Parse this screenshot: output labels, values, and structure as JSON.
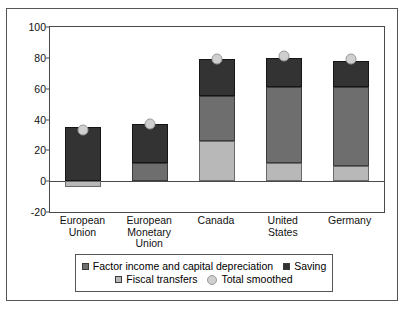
{
  "chart_data": {
    "type": "bar",
    "title": "",
    "subtitle": "",
    "xlabel": "",
    "ylabel": "",
    "ylim": [
      -20,
      100
    ],
    "yticks": [
      -20,
      0,
      20,
      40,
      60,
      80,
      100
    ],
    "ytick_labels": [
      "-20",
      "0",
      "20",
      "40",
      "60",
      "80",
      "100"
    ],
    "grid": false,
    "stacked": true,
    "legend_position": "bottom",
    "categories": [
      "European Union",
      "European Monetary Union",
      "Canada",
      "United States",
      "Germany"
    ],
    "category_lines": [
      [
        "European",
        "Union"
      ],
      [
        "European",
        "Monetary",
        "Union"
      ],
      [
        "Canada"
      ],
      [
        "United",
        "States"
      ],
      [
        "Germany"
      ]
    ],
    "series": [
      {
        "name": "Fiscal transfers",
        "color": "#b8b8b8",
        "values": [
          -4,
          0,
          26,
          12,
          10
        ]
      },
      {
        "name": "Factor income and capital depreciation",
        "color": "#6e6e6e",
        "values": [
          0,
          12,
          29,
          49,
          51
        ]
      },
      {
        "name": "Saving",
        "color": "#333333",
        "values": [
          35,
          25,
          24,
          19,
          17
        ]
      }
    ],
    "marker_series": {
      "name": "Total smoothed",
      "color": "#cfcfcf",
      "values": [
        33,
        37,
        79,
        81,
        79
      ]
    },
    "bar_tops": [
      35,
      37,
      79,
      80,
      78
    ],
    "legend": [
      {
        "label": "Factor income and capital depreciation",
        "color": "#6e6e6e",
        "marker": "square"
      },
      {
        "label": "Saving",
        "color": "#333333",
        "marker": "square"
      },
      {
        "label": "Fiscal transfers",
        "color": "#b8b8b8",
        "marker": "square"
      },
      {
        "label": "Total smoothed",
        "color": "#cfcfcf",
        "marker": "circle"
      }
    ]
  }
}
